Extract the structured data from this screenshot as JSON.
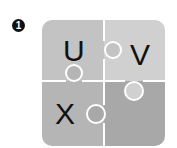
{
  "badge": {
    "number": "1"
  },
  "puzzle": {
    "pieces": [
      {
        "id": "top-left",
        "letter": "U",
        "color": "#c3c3c3"
      },
      {
        "id": "top-right",
        "letter": "V",
        "color": "#d0d0d0"
      },
      {
        "id": "bottom-left",
        "letter": "X",
        "color": "#b5b5b5"
      },
      {
        "id": "bottom-right",
        "letter": "",
        "color": "#a8a8a8"
      }
    ],
    "separator_color": "#ffffff"
  }
}
